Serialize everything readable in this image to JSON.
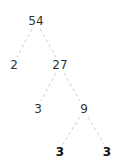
{
  "diagram": {
    "type": "factor-tree",
    "edge_color": "#cccccc",
    "nodes": [
      {
        "id": "n54",
        "label": "54",
        "x": 36,
        "y": 21,
        "bold": false
      },
      {
        "id": "n2",
        "label": "2",
        "x": 14,
        "y": 65,
        "bold": false
      },
      {
        "id": "n27",
        "label": "27",
        "x": 60,
        "y": 65,
        "bold": false
      },
      {
        "id": "n3a",
        "label": "3",
        "x": 38,
        "y": 109,
        "bold": false
      },
      {
        "id": "n9",
        "label": "9",
        "x": 84,
        "y": 109,
        "bold": false
      },
      {
        "id": "n3b",
        "label": "3",
        "x": 60,
        "y": 152,
        "bold": true
      },
      {
        "id": "n3c",
        "label": "3",
        "x": 107,
        "y": 152,
        "bold": true
      }
    ],
    "edges": [
      [
        "n54",
        "n2"
      ],
      [
        "n54",
        "n27"
      ],
      [
        "n27",
        "n3a"
      ],
      [
        "n27",
        "n9"
      ],
      [
        "n9",
        "n3b"
      ],
      [
        "n9",
        "n3c"
      ]
    ]
  }
}
